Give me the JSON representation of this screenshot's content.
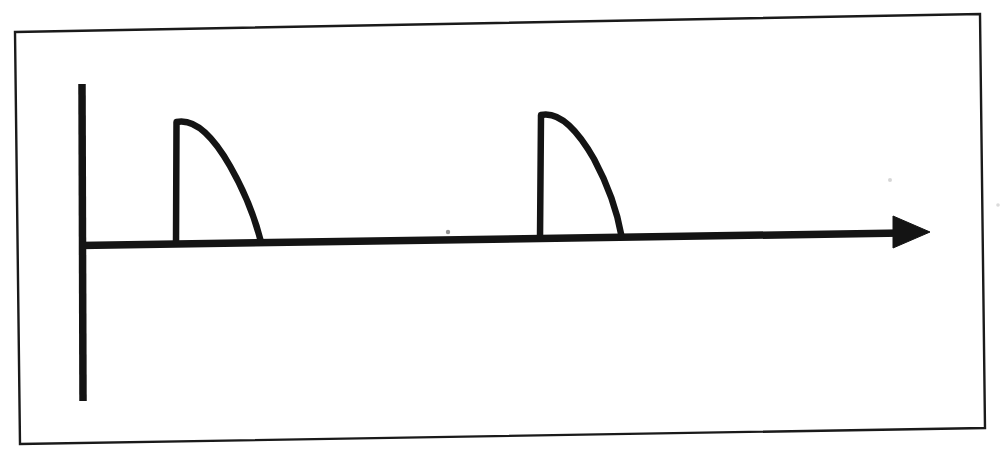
{
  "canvas": {
    "width": 1003,
    "height": 455,
    "background": "#ffffff",
    "ink": "#141414",
    "border_ink": "#1a1a1a"
  },
  "figure": {
    "title": "",
    "caption": "",
    "style": "hand-drawn pen sketch"
  },
  "border_frame": {
    "name": "photo-edge-border",
    "stroke_width": 2.4,
    "color": "#1a1a1a",
    "points": "15,32 980,14 985,428 20,444"
  },
  "y_axis": {
    "label": "",
    "x": 82,
    "top_y": 84,
    "bottom_y": 401,
    "stroke_width": 7.5,
    "color": "#141414"
  },
  "x_axis": {
    "label": "",
    "start_x": 80,
    "start_y": 245.5,
    "end_x": 903,
    "end_y": 233,
    "stroke_width": 7.5,
    "color": "#141414",
    "arrowhead": {
      "name": "axis-arrowhead",
      "tip_x": 930,
      "tip_y": 232,
      "back_x": 893,
      "half_height": 16,
      "filled": true,
      "color": "#141414"
    }
  },
  "chart_data": {
    "type": "line",
    "title": "",
    "xlabel": "",
    "ylabel": "",
    "grid": false,
    "legend": null,
    "axis_style": "arrow-terminated time axis",
    "xlim": [
      0,
      1
    ],
    "ylim": [
      0,
      1
    ],
    "series": [
      {
        "name": "pulse-train",
        "color": "#141414",
        "stroke_width": 6.5,
        "shape": "sawtooth-with-convex-decay",
        "pulse_count": 2,
        "annotations": [
          "instantaneous vertical rise",
          "convex (concave-down) decay back to baseline"
        ]
      }
    ],
    "pulses": [
      {
        "index": 1,
        "name": "pulse-1",
        "rise_x": 176,
        "baseline_y": 243,
        "peak_x": 180,
        "peak_y": 121,
        "fall_x": 262,
        "fall_y": 242,
        "amplitude_px": 122,
        "width_px": 86,
        "path": "M 176,243 L 176.5,122 C 196,118 214,138 230,166 C 246,194 256,222 261,242"
      },
      {
        "index": 2,
        "name": "pulse-2",
        "rise_x": 540,
        "baseline_y": 238,
        "peak_x": 543,
        "peak_y": 114,
        "fall_x": 622,
        "fall_y": 236,
        "amplitude_px": 124,
        "width_px": 82,
        "path": "M 540,238 L 541,115 C 560,111 578,131 594,159 C 609,187 618,216 621.5,236"
      }
    ],
    "period_px": 364,
    "values_note": "Two identical repeating pulses; each rises vertically then decays along a convex arc to the baseline."
  },
  "labels": {
    "items": []
  }
}
